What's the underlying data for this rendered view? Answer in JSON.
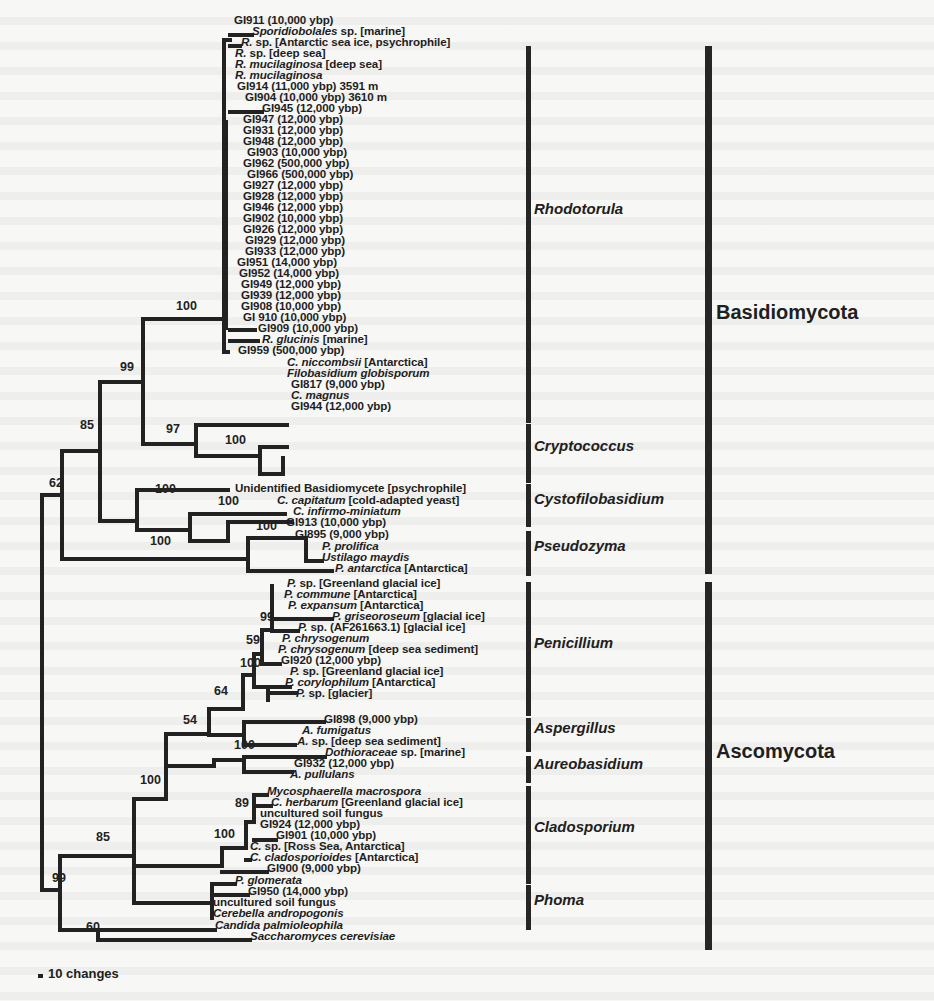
{
  "figure": {
    "scale_label": "10 changes",
    "phyla": [
      {
        "name": "Basidiomycota",
        "bar_top": 46,
        "bar_bottom": 574,
        "label_y": 313
      },
      {
        "name": "Ascomycota",
        "bar_top": 582,
        "bar_bottom": 950,
        "label_y": 752
      }
    ],
    "clades": [
      {
        "name": "Rhodotorula",
        "bar_top": 46,
        "bar_bottom": 423,
        "label_y": 209
      },
      {
        "name": "Cryptococcus",
        "bar_top": 424,
        "bar_bottom": 483,
        "label_y": 446
      },
      {
        "name": "Cystofilobasidium",
        "bar_top": 484,
        "bar_bottom": 527,
        "label_y": 499
      },
      {
        "name": "Pseudozyma",
        "bar_top": 531,
        "bar_bottom": 576,
        "label_y": 546
      },
      {
        "name": "Penicillium",
        "bar_top": 582,
        "bar_bottom": 716,
        "label_y": 643
      },
      {
        "name": "Aspergillus",
        "bar_top": 718,
        "bar_bottom": 752,
        "label_y": 728
      },
      {
        "name": "Aureobasidium",
        "bar_top": 756,
        "bar_bottom": 783,
        "label_y": 764
      },
      {
        "name": "Cladosporium",
        "bar_top": 786,
        "bar_bottom": 884,
        "label_y": 827
      },
      {
        "name": "Phoma",
        "bar_top": 885,
        "bar_bottom": 930,
        "label_y": 900
      }
    ],
    "taxa": [
      {
        "x": 234,
        "y": 20,
        "italic": "",
        "text": "GI911 (10,000 ybp)"
      },
      {
        "x": 252,
        "y": 31,
        "italic": "Sporidiobolales",
        "text": " sp. [marine]"
      },
      {
        "x": 241,
        "y": 42,
        "italic": "R.",
        "text": " sp. [Antarctic sea ice, psychrophile]"
      },
      {
        "x": 235,
        "y": 53,
        "italic": "R.",
        "text": " sp. [deep sea]"
      },
      {
        "x": 235,
        "y": 64,
        "italic": "R. mucilaginosa",
        "text": " [deep sea]"
      },
      {
        "x": 235,
        "y": 75,
        "italic": "R. mucilaginosa",
        "text": ""
      },
      {
        "x": 237,
        "y": 86,
        "italic": "",
        "text": "GI914 (11,000 ybp) 3591 m"
      },
      {
        "x": 245,
        "y": 97,
        "italic": "",
        "text": "GI904 (10,000 ybp) 3610 m"
      },
      {
        "x": 262,
        "y": 108,
        "italic": "",
        "text": "GI945 (12,000 ybp)"
      },
      {
        "x": 243,
        "y": 119,
        "italic": "",
        "text": "GI947 (12,000 ybp)"
      },
      {
        "x": 243,
        "y": 130,
        "italic": "",
        "text": "GI931 (12,000 ybp)"
      },
      {
        "x": 243,
        "y": 141,
        "italic": "",
        "text": "GI948 (12,000 ybp)"
      },
      {
        "x": 247,
        "y": 152,
        "italic": "",
        "text": "GI903 (10,000 ybp)"
      },
      {
        "x": 243,
        "y": 163,
        "italic": "",
        "text": "GI962 (500,000 ybp)"
      },
      {
        "x": 247,
        "y": 174,
        "italic": "",
        "text": "GI966 (500,000 ybp)"
      },
      {
        "x": 243,
        "y": 185,
        "italic": "",
        "text": "GI927 (12,000 ybp)"
      },
      {
        "x": 243,
        "y": 196,
        "italic": "",
        "text": "GI928 (12,000 ybp)"
      },
      {
        "x": 243,
        "y": 207,
        "italic": "",
        "text": "GI946 (12,000 ybp)"
      },
      {
        "x": 243,
        "y": 218,
        "italic": "",
        "text": "GI902 (10,000 ybp)"
      },
      {
        "x": 243,
        "y": 229,
        "italic": "",
        "text": "GI926 (12,000 ybp)"
      },
      {
        "x": 245,
        "y": 240,
        "italic": "",
        "text": "GI929 (12,000 ybp)"
      },
      {
        "x": 245,
        "y": 251,
        "italic": "",
        "text": "GI933 (12,000 ybp)"
      },
      {
        "x": 237,
        "y": 262,
        "italic": "",
        "text": "GI951 (14,000 ybp)"
      },
      {
        "x": 239,
        "y": 273,
        "italic": "",
        "text": "GI952 (14,000 ybp)"
      },
      {
        "x": 241,
        "y": 284,
        "italic": "",
        "text": "GI949 (12,000 ybp)"
      },
      {
        "x": 241,
        "y": 295,
        "italic": "",
        "text": "GI939 (12,000 ybp)"
      },
      {
        "x": 241,
        "y": 306,
        "italic": "",
        "text": "GI908 (10,000 ybp)"
      },
      {
        "x": 243,
        "y": 317,
        "italic": "",
        "text": "GI 910 (10,000 ybp)"
      },
      {
        "x": 258,
        "y": 328,
        "italic": "",
        "text": "GI909 (10,000 ybp)"
      },
      {
        "x": 262,
        "y": 339,
        "italic": "R. glucinis",
        "text": " [marine]"
      },
      {
        "x": 238,
        "y": 350,
        "italic": "",
        "text": "GI959 (500,000 ybp)"
      },
      {
        "x": 287,
        "y": 362,
        "italic": "C. niccombsii",
        "text": " [Antarctica]"
      },
      {
        "x": 287,
        "y": 373,
        "italic": "Filobasidium globisporum",
        "text": ""
      },
      {
        "x": 291,
        "y": 384,
        "italic": "",
        "text": "GI817 (9,000 ybp)"
      },
      {
        "x": 291,
        "y": 395,
        "italic": "C. magnus",
        "text": ""
      },
      {
        "x": 291,
        "y": 406,
        "italic": "",
        "text": "GI944 (12,000 ybp)"
      },
      {
        "x": 235,
        "y": 488,
        "italic": "",
        "text": "Unidentified Basidiomycete [psychrophile]"
      },
      {
        "x": 277,
        "y": 500,
        "italic": "C. capitatum",
        "text": " [cold-adapted yeast]"
      },
      {
        "x": 293,
        "y": 511,
        "italic": "C. infirmo-miniatum",
        "text": ""
      },
      {
        "x": 286,
        "y": 522,
        "italic": "",
        "text": "GI913 (10,000 ybp)"
      },
      {
        "x": 295,
        "y": 534,
        "italic": "",
        "text": "GI895 (9,000 ybp)"
      },
      {
        "x": 322,
        "y": 546,
        "italic": "P. prolifica",
        "text": ""
      },
      {
        "x": 322,
        "y": 557,
        "italic": "Ustilago maydis",
        "text": ""
      },
      {
        "x": 335,
        "y": 568,
        "italic": "P. antarctica",
        "text": " [Antarctica]"
      },
      {
        "x": 287,
        "y": 583,
        "italic": "P.",
        "text": " sp. [Greenland glacial ice]"
      },
      {
        "x": 284,
        "y": 594,
        "italic": "P. commune",
        "text": " [Antarctica]"
      },
      {
        "x": 288,
        "y": 605,
        "italic": "P. expansum",
        "text": " [Antarctica]"
      },
      {
        "x": 332,
        "y": 616,
        "italic": "P. griseoroseum",
        "text": " [glacial ice]"
      },
      {
        "x": 298,
        "y": 627,
        "italic": "P.",
        "text": " sp. (AF261663.1) [glacial ice]"
      },
      {
        "x": 282,
        "y": 638,
        "italic": "P. chrysogenum",
        "text": ""
      },
      {
        "x": 278,
        "y": 649,
        "italic": "P. chrysogenum",
        "text": " [deep sea sediment]"
      },
      {
        "x": 281,
        "y": 660,
        "italic": "",
        "text": "GI920 (12,000 ybp)"
      },
      {
        "x": 290,
        "y": 671,
        "italic": "P.",
        "text": " sp. [Greenland glacial ice]"
      },
      {
        "x": 285,
        "y": 682,
        "italic": "P. corylophilum",
        "text": " [Antarctica]"
      },
      {
        "x": 296,
        "y": 693,
        "italic": "P.",
        "text": " sp. [glacier]"
      },
      {
        "x": 324,
        "y": 719,
        "italic": "",
        "text": "GI898 (9,000 ybp)"
      },
      {
        "x": 302,
        "y": 730,
        "italic": "A. fumigatus",
        "text": ""
      },
      {
        "x": 297,
        "y": 741,
        "italic": "A.",
        "text": " sp. [deep sea sediment]"
      },
      {
        "x": 325,
        "y": 752,
        "italic": "Dothioraceae",
        "text": " sp. [marine]"
      },
      {
        "x": 294,
        "y": 763,
        "italic": "",
        "text": "GI932 (12,000 ybp)"
      },
      {
        "x": 290,
        "y": 774,
        "italic": "A. pullulans",
        "text": ""
      },
      {
        "x": 267,
        "y": 791,
        "italic": "Mycosphaerella macrospora",
        "text": ""
      },
      {
        "x": 271,
        "y": 802,
        "italic": "C. herbarum",
        "text": " [Greenland glacial ice]"
      },
      {
        "x": 260,
        "y": 813,
        "italic": "",
        "text": "uncultured soil fungus"
      },
      {
        "x": 260,
        "y": 824,
        "italic": "",
        "text": "GI924 (12,000 ybp)"
      },
      {
        "x": 276,
        "y": 835,
        "italic": "",
        "text": "GI901 (10,000 ybp)"
      },
      {
        "x": 250,
        "y": 846,
        "italic": "C.",
        "text": " sp. [Ross Sea, Antarctica]"
      },
      {
        "x": 250,
        "y": 857,
        "italic": "C. cladosporioides",
        "text": " [Antarctica]"
      },
      {
        "x": 267,
        "y": 868,
        "italic": "",
        "text": "GI900 (9,000 ybp)"
      },
      {
        "x": 235,
        "y": 880,
        "italic": "P. glomerata",
        "text": ""
      },
      {
        "x": 248,
        "y": 891,
        "italic": "",
        "text": "GI950 (14,000 ybp)"
      },
      {
        "x": 213,
        "y": 902,
        "italic": "",
        "text": "uncultured soil fungus"
      },
      {
        "x": 213,
        "y": 913,
        "italic": "Cerebella andropogonis",
        "text": ""
      },
      {
        "x": 215,
        "y": 925,
        "italic": "Candida palmioleophila",
        "text": ""
      },
      {
        "x": 250,
        "y": 936,
        "italic": "Saccharomyces cerevisiae",
        "text": ""
      }
    ],
    "bootstrap": [
      {
        "x": 176,
        "y": 313,
        "value": "100"
      },
      {
        "x": 120,
        "y": 374,
        "value": "99"
      },
      {
        "x": 166,
        "y": 436,
        "value": "97"
      },
      {
        "x": 225,
        "y": 447,
        "value": "100"
      },
      {
        "x": 80,
        "y": 432,
        "value": "85"
      },
      {
        "x": 49,
        "y": 490,
        "value": "62"
      },
      {
        "x": 155,
        "y": 496,
        "value": "100"
      },
      {
        "x": 218,
        "y": 508,
        "value": "100"
      },
      {
        "x": 256,
        "y": 533,
        "value": "100"
      },
      {
        "x": 150,
        "y": 548,
        "value": "100"
      },
      {
        "x": 260,
        "y": 624,
        "value": "99"
      },
      {
        "x": 246,
        "y": 647,
        "value": "59"
      },
      {
        "x": 240,
        "y": 670,
        "value": "100"
      },
      {
        "x": 214,
        "y": 698,
        "value": "64"
      },
      {
        "x": 183,
        "y": 727,
        "value": "54"
      },
      {
        "x": 234,
        "y": 752,
        "value": "100"
      },
      {
        "x": 140,
        "y": 787,
        "value": "100"
      },
      {
        "x": 235,
        "y": 810,
        "value": "89"
      },
      {
        "x": 214,
        "y": 841,
        "value": "100"
      },
      {
        "x": 96,
        "y": 844,
        "value": "85"
      },
      {
        "x": 52,
        "y": 885,
        "value": "99"
      },
      {
        "x": 86,
        "y": 934,
        "value": "60"
      }
    ]
  }
}
